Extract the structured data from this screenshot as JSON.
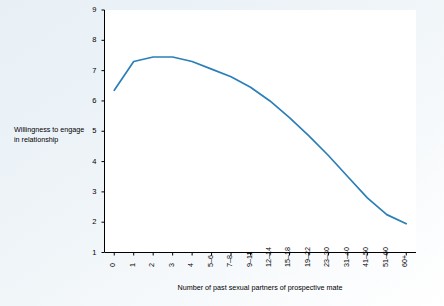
{
  "chart_data": {
    "type": "line",
    "title": "",
    "xlabel": "Number of past sexual partners of prospective mate",
    "ylabel": "Willingness to engage in relationship",
    "categories": [
      "0",
      "1",
      "2",
      "3",
      "4",
      "5–6",
      "7–8",
      "9–11",
      "12–14",
      "15–18",
      "19–22",
      "23–30",
      "31–40",
      "41–50",
      "51–60",
      "60+"
    ],
    "values": [
      6.35,
      7.3,
      7.45,
      7.45,
      7.3,
      7.05,
      6.8,
      6.45,
      6.0,
      5.45,
      4.85,
      4.2,
      3.5,
      2.8,
      2.25,
      1.95
    ],
    "ylim": [
      1,
      9
    ],
    "yticks": [
      "1",
      "2",
      "3",
      "4",
      "5",
      "6",
      "7",
      "8",
      "9"
    ],
    "grid": false,
    "legend": "none",
    "line_color": "#2b7fb8",
    "axis_color": "#000000"
  },
  "ylabel_lines": [
    "Willingness to engage",
    "in relationship"
  ]
}
